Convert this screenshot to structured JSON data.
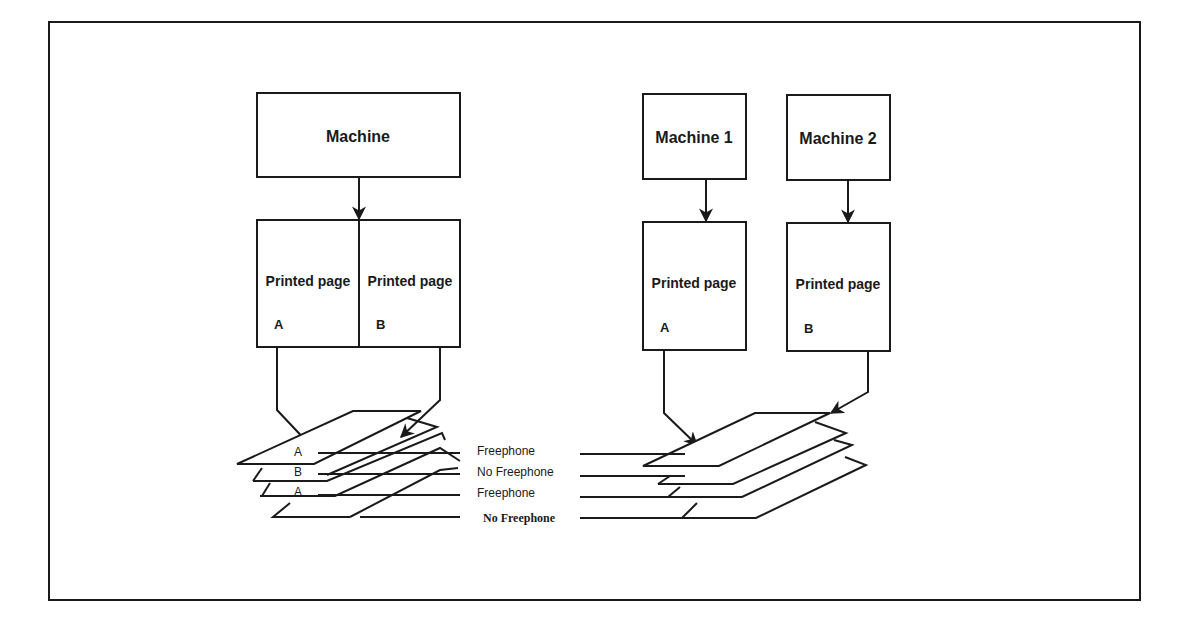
{
  "left_setup": {
    "machine": {
      "label": "Machine"
    },
    "pages": [
      {
        "label": "Printed page",
        "letter": "A"
      },
      {
        "label": "Printed page",
        "letter": "B"
      }
    ],
    "stack_letters": [
      "A",
      "B",
      "A"
    ]
  },
  "right_setup": {
    "machines": [
      {
        "label": "Machine 1",
        "page_label": "Printed page",
        "letter": "A"
      },
      {
        "label": "Machine 2",
        "page_label": "Printed page",
        "letter": "B"
      }
    ]
  },
  "legend": {
    "rows": [
      {
        "label": "Freephone"
      },
      {
        "label": "No Freephone"
      },
      {
        "label": "Freephone"
      },
      {
        "label": "No Freephone"
      }
    ]
  },
  "colors": {
    "stroke": "#1a1a1a",
    "background": "#ffffff"
  }
}
